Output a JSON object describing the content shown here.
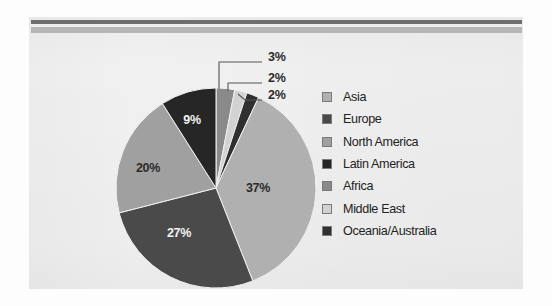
{
  "page": {
    "background_color": "#fdfdfd",
    "panel_color": "#f1f1f1",
    "top_rule_dark_color": "#6e6e6e",
    "top_rule_light_color": "#b6b6b6"
  },
  "chart_data": {
    "type": "pie",
    "title": "",
    "categories": [
      "Asia",
      "Europe",
      "North America",
      "Latin America",
      "Africa",
      "Middle East",
      "Oceania/Australia"
    ],
    "values": [
      37,
      27,
      20,
      9,
      3,
      2,
      2
    ],
    "value_labels": [
      "37%",
      "27%",
      "20%",
      "9%",
      "3%",
      "2%",
      "2%"
    ],
    "units": "percent",
    "colors": [
      "#b0b0b0",
      "#4a4a4a",
      "#a0a0a0",
      "#262626",
      "#8a8a8a",
      "#d2d2d2",
      "#303030"
    ],
    "label_text_colors": [
      "#2b2b2b",
      "#f2f2f2",
      "#2b2b2b",
      "#f2f2f2",
      "#2b2b2b",
      "#2b2b2b",
      "#2b2b2b"
    ],
    "start_angle_deg": 0,
    "direction": "clockwise",
    "draw_order": [
      "Africa",
      "Middle East",
      "Oceania/Australia",
      "Asia",
      "Europe",
      "North America",
      "Latin America"
    ],
    "legend_position": "right",
    "grid": false,
    "callouts": [
      {
        "label": "3%",
        "series": "Africa"
      },
      {
        "label": "2%",
        "series": "Middle East"
      },
      {
        "label": "2%",
        "series": "Oceania/Australia"
      }
    ]
  },
  "legend": {
    "items": [
      {
        "label": "Asia",
        "color": "#b0b0b0"
      },
      {
        "label": "Europe",
        "color": "#4a4a4a"
      },
      {
        "label": "North America",
        "color": "#a0a0a0"
      },
      {
        "label": "Latin America",
        "color": "#262626"
      },
      {
        "label": "Africa",
        "color": "#8a8a8a"
      },
      {
        "label": "Middle East",
        "color": "#d2d2d2"
      },
      {
        "label": "Oceania/Australia",
        "color": "#303030"
      }
    ]
  },
  "inner_labels": [
    {
      "text": "37%",
      "x": 258,
      "y": 192,
      "tone": "dark"
    },
    {
      "text": "27%",
      "x": 179,
      "y": 237,
      "tone": "light"
    },
    {
      "text": "20%",
      "x": 148,
      "y": 172,
      "tone": "dark"
    },
    {
      "text": "9%",
      "x": 192,
      "y": 124,
      "tone": "light"
    }
  ],
  "callout_labels": [
    {
      "text": "3%",
      "x": 268,
      "y": 61
    },
    {
      "text": "2%",
      "x": 268,
      "y": 82
    },
    {
      "text": "2%",
      "x": 268,
      "y": 99
    }
  ]
}
